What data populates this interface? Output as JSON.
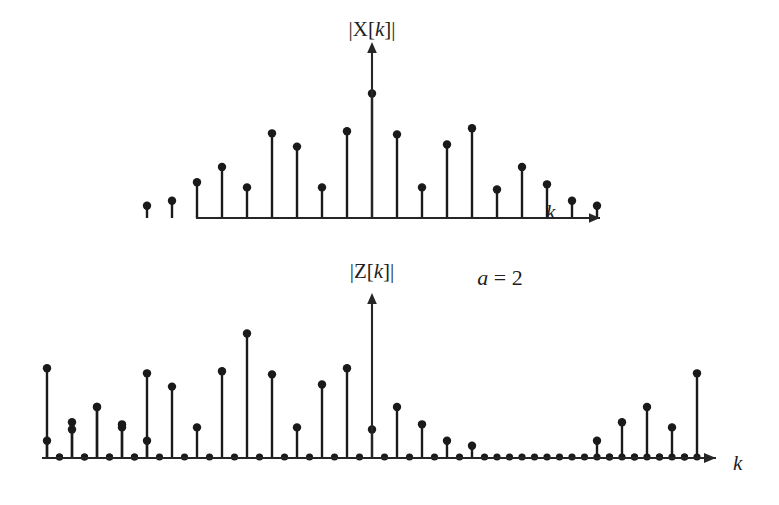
{
  "figure": {
    "title": "",
    "background_color": "#ffffff",
    "ink_color": "#1a1a1a",
    "annotation": {
      "text": "a = 2",
      "var": "a",
      "rest": " = 2",
      "x": 500,
      "y": 285
    }
  },
  "panels": [
    {
      "id": "top",
      "ylabel": "|X[k]|",
      "ylabel_prefix": "|X[",
      "ylabel_var": "k",
      "ylabel_suffix": "]|",
      "ylabel_x": 372,
      "ylabel_y": 36,
      "xlabel": "k",
      "xlabel_x": 546,
      "xlabel_y": 219,
      "baseline_y": 218,
      "axis_x": 372,
      "axis_left": 196,
      "axis_right": 600,
      "axis_top": 52,
      "spacing": 25.0
    },
    {
      "id": "bottom",
      "ylabel": "|Z[k]|",
      "ylabel_prefix": "|Z[",
      "ylabel_var": "k",
      "ylabel_suffix": "]|",
      "ylabel_x": 372,
      "ylabel_y": 278,
      "xlabel": "k",
      "xlabel_x": 733,
      "xlabel_y": 470,
      "baseline_y": 458,
      "axis_x": 372,
      "axis_left": 42,
      "axis_right": 716,
      "axis_top": 303,
      "spacing": 12.5
    }
  ],
  "chart_data": [
    {
      "type": "stem",
      "id": "top-panel",
      "title": "|X[k]|",
      "xlabel": "k",
      "ylabel": "|X[k]|",
      "grid": false,
      "legend": "none",
      "xlim": [
        -9,
        9
      ],
      "ylim": [
        0,
        130
      ],
      "description": "Magnitude of DFT X[k], 19 stems, envelope peaking at k = 0",
      "x": [
        -8,
        -7,
        -6,
        -5,
        -4,
        -3,
        -2,
        -1,
        0,
        1,
        2,
        3,
        4,
        5,
        6,
        7,
        8
      ],
      "categories": [
        "-8",
        "-7",
        "-6",
        "-5",
        "-4",
        "-3",
        "-2",
        "-1",
        "0",
        "1",
        "2",
        "3",
        "4",
        "5",
        "6",
        "7",
        "8"
      ],
      "values": [
        17,
        35,
        50,
        30,
        83,
        70,
        30,
        85,
        122,
        82,
        30,
        72,
        88,
        28,
        50,
        33,
        17
      ],
      "extra_left_stem": {
        "x": -9,
        "value": 12
      },
      "extra_right_stem": {
        "x": 9,
        "value": 12
      },
      "stem_pixel_x": [
        212,
        237,
        262,
        287,
        312,
        337,
        362,
        372,
        397,
        422,
        447,
        472,
        497,
        522,
        547,
        572
      ],
      "stem_head_radius": 4.2
    },
    {
      "type": "stem",
      "id": "bottom-panel",
      "title": "|Z[k]|",
      "xlabel": "k",
      "ylabel": "|Z[k]|",
      "grid": false,
      "legend": "none",
      "xlim": [
        -27,
        27
      ],
      "ylim": [
        0,
        130
      ],
      "description": "Magnitude of Z[k], the a=2 upsampled (zero-interleaved) version of X[k]; every odd index is zero",
      "x": [
        -26,
        -25,
        -24,
        -23,
        -22,
        -21,
        -20,
        -19,
        -18,
        -17,
        -16,
        -15,
        -14,
        -13,
        -12,
        -11,
        -10,
        -9,
        -8,
        -7,
        -6,
        -5,
        -4,
        -3,
        -2,
        -1,
        0,
        1,
        2,
        3,
        4,
        5,
        6,
        7,
        8,
        9,
        10,
        11,
        12,
        13,
        14,
        15,
        16,
        17,
        18,
        19,
        20,
        21,
        22,
        23,
        24,
        25,
        26
      ],
      "values": [
        17,
        0,
        35,
        0,
        50,
        0,
        30,
        0,
        83,
        0,
        70,
        0,
        30,
        0,
        85,
        0,
        122,
        0,
        82,
        0,
        30,
        0,
        72,
        0,
        88,
        0,
        28,
        0,
        50,
        0,
        33,
        0,
        17,
        0,
        12,
        0,
        0,
        0,
        0,
        0,
        0,
        0,
        0,
        0,
        0,
        0,
        0,
        0,
        0,
        0,
        0,
        0,
        0
      ],
      "stem_head_radius": 4.2,
      "zero_marker_radius": 3.6
    }
  ]
}
